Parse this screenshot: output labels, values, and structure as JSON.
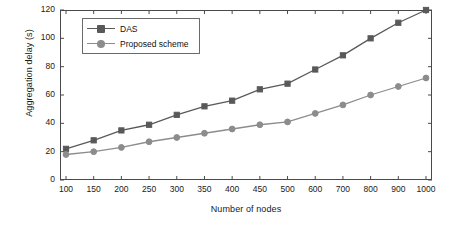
{
  "chart_data": {
    "type": "line",
    "title": "",
    "xlabel": "Number of nodes",
    "ylabel": "Aggregation delay (s)",
    "xlim": [
      100,
      1000
    ],
    "ylim": [
      0,
      120
    ],
    "grid": false,
    "legend_position": "top-left",
    "x": [
      100,
      150,
      200,
      250,
      300,
      350,
      400,
      450,
      500,
      600,
      700,
      800,
      900,
      1000
    ],
    "xticks": [
      "100",
      "150",
      "200",
      "250",
      "300",
      "350",
      "400",
      "450",
      "500",
      "600",
      "700",
      "800",
      "900",
      "1000"
    ],
    "yticks": [
      "0",
      "20",
      "40",
      "60",
      "80",
      "100",
      "120"
    ],
    "series": [
      {
        "name": "DAS",
        "color": "#595959",
        "marker": "square",
        "values": [
          22,
          28,
          35,
          39,
          46,
          52,
          56,
          64,
          68,
          78,
          88,
          100,
          111,
          120
        ]
      },
      {
        "name": "Proposed scheme",
        "color": "#8c8c8c",
        "marker": "circle",
        "values": [
          18,
          20,
          23,
          27,
          30,
          33,
          36,
          39,
          41,
          47,
          53,
          60,
          66,
          72
        ]
      }
    ]
  },
  "axes": {
    "x_title": "Number of nodes",
    "y_title": "Aggregation delay (s)"
  },
  "legend": {
    "items": [
      {
        "label": "DAS"
      },
      {
        "label": "Proposed scheme"
      }
    ]
  }
}
